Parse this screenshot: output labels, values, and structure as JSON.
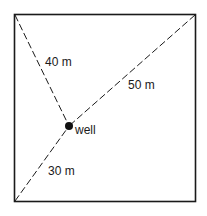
{
  "diagram": {
    "shape": "square",
    "labels": {
      "top_left_distance": "40 m",
      "top_right_distance": "50 m",
      "bottom_left_distance": "30 m",
      "well": "well"
    },
    "colors": {
      "stroke": "#1a1a1a",
      "background": "#ffffff"
    }
  }
}
